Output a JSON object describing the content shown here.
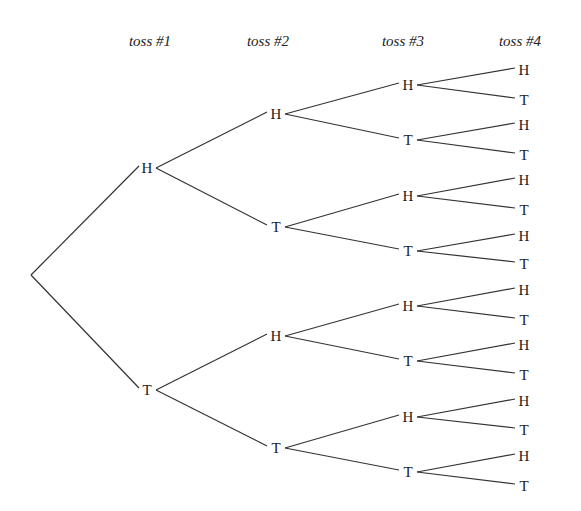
{
  "diagram": {
    "type": "probability tree",
    "headers": [
      "toss #1",
      "toss #2",
      "toss #3",
      "toss #4"
    ],
    "outcomes": [
      "H",
      "T"
    ],
    "levels": [
      [
        "H",
        "T"
      ],
      [
        "H",
        "T",
        "H",
        "T"
      ],
      [
        "H",
        "T",
        "H",
        "T",
        "H",
        "T",
        "H",
        "T"
      ],
      [
        "H",
        "T",
        "H",
        "T",
        "H",
        "T",
        "H",
        "T",
        "H",
        "T",
        "H",
        "T",
        "H",
        "T",
        "H",
        "T"
      ]
    ]
  }
}
